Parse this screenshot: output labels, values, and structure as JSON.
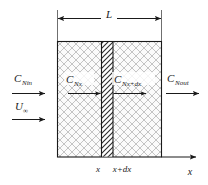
{
  "figure": {
    "type": "schematic-diagram"
  },
  "dimension": {
    "length_label": "L"
  },
  "inlet": {
    "concentration_symbol": "C",
    "concentration_subscript": "Nin",
    "velocity_symbol": "U",
    "velocity_subscript": "∞"
  },
  "control_volume": {
    "flux_in_symbol": "C",
    "flux_in_subscript": "Nx",
    "flux_out_symbol": "C",
    "flux_out_subscript": "Nx+dx"
  },
  "outlet": {
    "concentration_symbol": "C",
    "concentration_subscript": "Nout"
  },
  "axis": {
    "label": "x",
    "ticks": [
      {
        "label": "x"
      },
      {
        "label": "x+dx"
      }
    ]
  },
  "colors": {
    "line": "#1a1a1a",
    "hatch_light": "#b4b4b4",
    "hatch_dark": "#262626",
    "background": "#ffffff",
    "slab_fill": "#fafafa"
  }
}
